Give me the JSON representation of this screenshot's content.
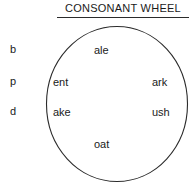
{
  "title": {
    "text": "CONSONANT WHEEL",
    "underline": true
  },
  "consonants": [
    {
      "label": "b"
    },
    {
      "label": "p"
    },
    {
      "label": "d"
    }
  ],
  "wheel": {
    "shape": "circle",
    "stroke_color": "#2b2b2b",
    "fill_color": "#ffffff",
    "rimes": [
      {
        "label": "ale",
        "position": "top"
      },
      {
        "label": "ent",
        "position": "upper-left"
      },
      {
        "label": "ark",
        "position": "upper-right"
      },
      {
        "label": "ake",
        "position": "lower-left"
      },
      {
        "label": "ush",
        "position": "lower-right"
      },
      {
        "label": "oat",
        "position": "bottom"
      }
    ]
  },
  "colors": {
    "background": "#ffffff",
    "ink": "#1a1a1a",
    "rule": "#2b2b2b"
  }
}
